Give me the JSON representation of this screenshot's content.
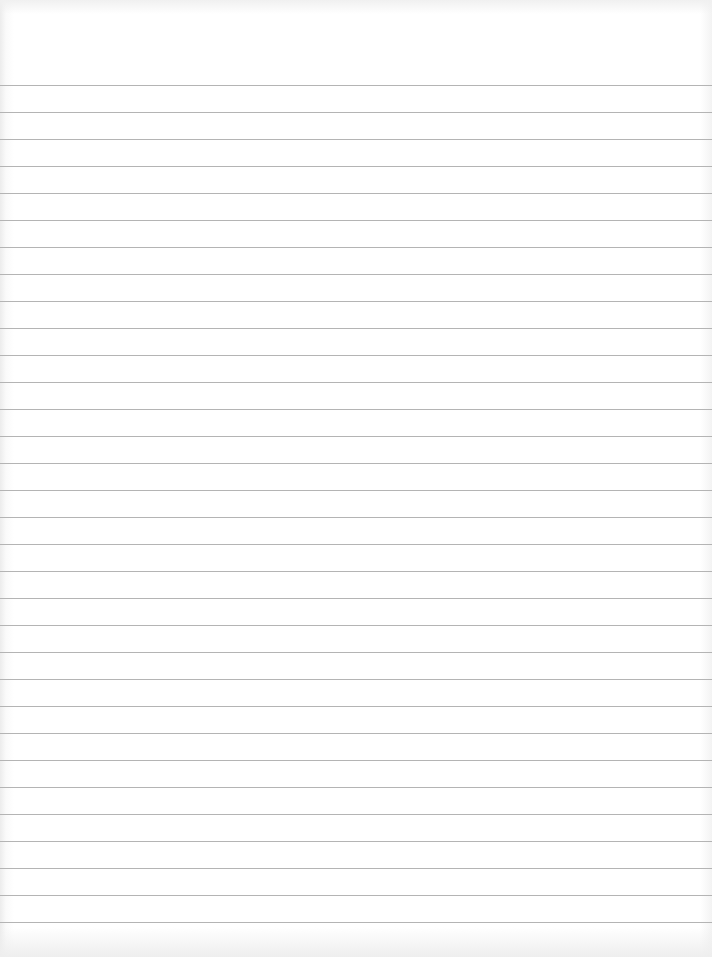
{
  "document": {
    "type": "lined-paper",
    "text": "",
    "rules": {
      "count": 32,
      "first_y": 85,
      "spacing": 27,
      "color": "#b4b4b4"
    },
    "background_color": "#ffffff"
  }
}
